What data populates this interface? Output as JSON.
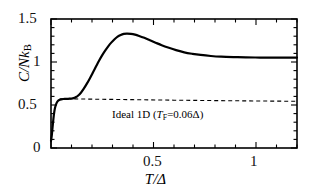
{
  "chart_data": {
    "type": "line",
    "title": "",
    "subtitle": "",
    "xlabel": "T/Δ",
    "ylabel": "C/Nk_B",
    "xlim": [
      0,
      1.2
    ],
    "ylim": [
      0,
      1.5
    ],
    "grid": false,
    "legend_position": "none",
    "xticks": [
      0,
      0.5,
      1
    ],
    "xtick_labels": [
      "0",
      "0.5",
      "1"
    ],
    "yticks": [
      0,
      0.5,
      1,
      1.5
    ],
    "ytick_labels": [
      "0",
      "0.5",
      "1",
      "1.5"
    ],
    "xminor_ticks": [
      0.1,
      0.2,
      0.3,
      0.4,
      0.6,
      0.7,
      0.8,
      0.9,
      1.1,
      1.2
    ],
    "yminor_ticks": [
      0.1,
      0.2,
      0.3,
      0.4,
      0.6,
      0.7,
      0.8,
      0.9,
      1.1,
      1.2,
      1.3,
      1.4
    ],
    "annotations": [
      {
        "name": "ideal-1d-label",
        "text": "Ideal 1D (T_F=0.06Δ)",
        "x": 0.36,
        "y": 0.42
      }
    ],
    "series": [
      {
        "name": "interacting-1d-specific-heat",
        "style": "solid",
        "color": "#000000",
        "linewidth": 2.2,
        "x": [
          0.0,
          0.004,
          0.008,
          0.012,
          0.016,
          0.02,
          0.026,
          0.032,
          0.04,
          0.05,
          0.06,
          0.07,
          0.08,
          0.09,
          0.1,
          0.11,
          0.12,
          0.13,
          0.145,
          0.16,
          0.175,
          0.19,
          0.205,
          0.22,
          0.235,
          0.25,
          0.265,
          0.28,
          0.295,
          0.31,
          0.325,
          0.34,
          0.355,
          0.37,
          0.39,
          0.41,
          0.43,
          0.455,
          0.48,
          0.51,
          0.54,
          0.575,
          0.61,
          0.65,
          0.69,
          0.73,
          0.78,
          0.83,
          0.89,
          0.95,
          1.02,
          1.09,
          1.15,
          1.2
        ],
        "y": [
          0.08,
          0.15,
          0.25,
          0.345,
          0.42,
          0.47,
          0.515,
          0.543,
          0.558,
          0.566,
          0.57,
          0.571,
          0.572,
          0.573,
          0.575,
          0.58,
          0.59,
          0.605,
          0.64,
          0.69,
          0.748,
          0.812,
          0.88,
          0.95,
          1.018,
          1.08,
          1.135,
          1.185,
          1.228,
          1.265,
          1.295,
          1.315,
          1.327,
          1.331,
          1.328,
          1.318,
          1.303,
          1.281,
          1.256,
          1.225,
          1.195,
          1.165,
          1.138,
          1.112,
          1.095,
          1.082,
          1.07,
          1.062,
          1.057,
          1.054,
          1.052,
          1.051,
          1.051,
          1.051
        ]
      },
      {
        "name": "ideal-1d-specific-heat",
        "style": "dashed",
        "color": "#000000",
        "linewidth": 1.1,
        "x": [
          0.045,
          0.2,
          0.4,
          0.6,
          0.8,
          1.0,
          1.2
        ],
        "y": [
          0.573,
          0.568,
          0.562,
          0.556,
          0.551,
          0.547,
          0.543
        ]
      }
    ]
  },
  "axes": {
    "y_title_main": "C/Nk",
    "y_title_sub": "B",
    "x_title": "T/Δ",
    "tick_labels": {
      "y_1_5": "1.5",
      "y_1_0": "1",
      "y_0_5": "0.5",
      "y_0_0": "0",
      "x_0_5": "0.5",
      "x_1_0": "1"
    }
  },
  "annotation": {
    "prefix": "Ideal 1D (",
    "symbol": "T",
    "symbol_sub": "F",
    "equals_value": "=0.06Δ",
    "suffix": ")"
  },
  "colors": {
    "axis": "#000000",
    "curve": "#000000",
    "background": "#ffffff"
  }
}
